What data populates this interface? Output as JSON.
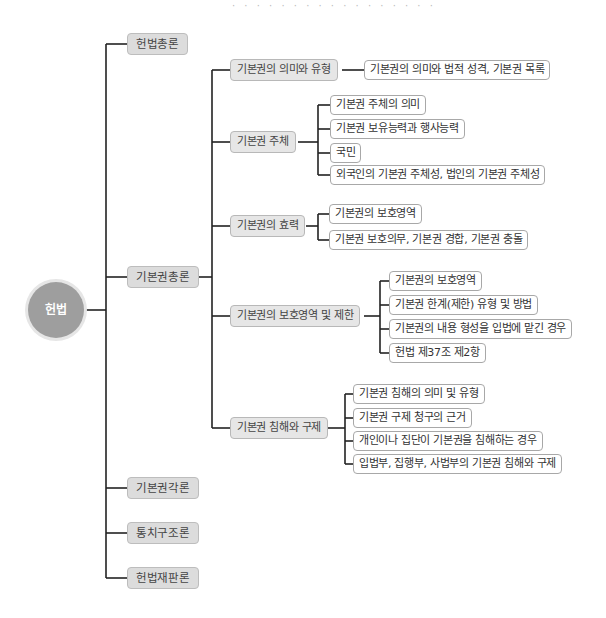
{
  "header": {
    "partial_text": "· · · · · · · · · · · · · · · · ·"
  },
  "mindmap": {
    "root": {
      "label": "헌법"
    },
    "branches": [
      {
        "label": "헌법총론",
        "children": []
      },
      {
        "label": "기본권총론",
        "children": [
          {
            "label": "기본권의 의미와 유형",
            "children": [
              {
                "label": "기본권의 의미와 법적 성격, 기본권 목록"
              }
            ]
          },
          {
            "label": "기본권 주체",
            "children": [
              {
                "label": "기본권 주체의 의미"
              },
              {
                "label": "기본권 보유능력과 행사능력"
              },
              {
                "label": "국민"
              },
              {
                "label": "외국인의 기본권 주체성, 법인의 기본권 주체성"
              }
            ]
          },
          {
            "label": "기본권의 효력",
            "children": [
              {
                "label": "기본권의 보호영역"
              },
              {
                "label": "기본권 보호의무, 기본권 경합, 기본권 충돌"
              }
            ]
          },
          {
            "label": "기본권의 보호영역 및 제한",
            "children": [
              {
                "label": "기본권의 보호영역"
              },
              {
                "label": "기본권 한계(제한) 유형 및 방법"
              },
              {
                "label": "기본권의 내용 형성을 입법에 맡긴 경우"
              },
              {
                "label": "헌법 제37조 제2항"
              }
            ]
          },
          {
            "label": "기본권 침해와 구제",
            "children": [
              {
                "label": "기본권 침해의 의미 및 유형"
              },
              {
                "label": "기본권 구제 청구의 근거"
              },
              {
                "label": "개인이나 집단이 기본권을 침해하는 경우"
              },
              {
                "label": "입법부, 집행부, 사법부의 기본권 침해와 구제"
              }
            ]
          }
        ]
      },
      {
        "label": "기본권각론",
        "children": []
      },
      {
        "label": "통치구조론",
        "children": []
      },
      {
        "label": "헌법재판론",
        "children": []
      }
    ]
  },
  "colors": {
    "root_fill": "#9e9e9e",
    "l1_fill": "#dcdcdc",
    "l2_fill": "#e6e6e6",
    "line": "#222222"
  }
}
